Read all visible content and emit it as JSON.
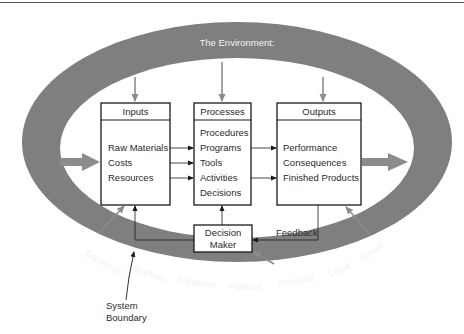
{
  "diagram": {
    "environment_title": "The Environment:",
    "boxes": {
      "inputs": {
        "title": "Inputs",
        "items": [
          "Raw Materials",
          "Costs",
          "Resources"
        ]
      },
      "processes": {
        "title": "Processes",
        "items": [
          "Procedures",
          "Programs",
          "Tools",
          "Activities",
          "Decisions"
        ]
      },
      "outputs": {
        "title": "Outputs",
        "items": [
          "Performance",
          "Consequences",
          "Finished Products"
        ]
      },
      "decision_maker": {
        "line1": "Decision",
        "line2": "Maker"
      }
    },
    "feedback_label": "Feedback",
    "environment_factors": [
      "Economic,",
      "Markets,",
      "Suppliers,",
      "Political,",
      "Physical,",
      "Legal,",
      "Social"
    ],
    "system_boundary": {
      "line1": "System",
      "line2": "Boundary"
    },
    "colors": {
      "ring": "#7f7f7f",
      "arrow_gray": "#8c8c8c",
      "box_border": "#1a1a1a",
      "text": "#2a2a2a"
    }
  }
}
